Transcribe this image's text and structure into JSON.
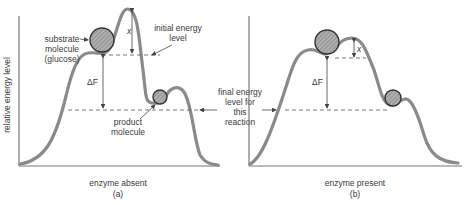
{
  "figure": {
    "y_axis_label": "relative energy level",
    "panels": [
      {
        "id": "a",
        "caption": "enzyme absent",
        "sublabel": "(a)",
        "labels": {
          "substrate": [
            "substrate",
            "molecule",
            "(glucose)"
          ],
          "initial": [
            "initial energy",
            "level"
          ],
          "delta": "ΔF",
          "x": "x",
          "product": [
            "product",
            "molecule"
          ]
        }
      },
      {
        "id": "b",
        "caption": "enzyme present",
        "sublabel": "(b)",
        "labels": {
          "delta": "ΔF",
          "x": "x"
        }
      }
    ],
    "shared_label": [
      "final energy",
      "level for",
      "this",
      "reaction"
    ]
  }
}
